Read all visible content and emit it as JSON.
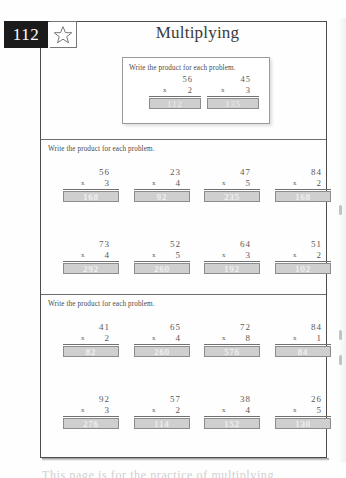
{
  "page": {
    "number": "112",
    "title": "Multiplying",
    "star_icon": "star-icon",
    "footer_text_partial": "This page is for the practice of multiplying"
  },
  "example": {
    "instruction": "Write the product for each problem.",
    "problems": [
      {
        "top": "56",
        "operator": "x",
        "bottom": "2",
        "answer": "112"
      },
      {
        "top": "45",
        "operator": "x",
        "bottom": "3",
        "answer": "135"
      }
    ]
  },
  "sections": [
    {
      "instruction": "Write the product for each problem.",
      "rows": [
        [
          {
            "top": "56",
            "operator": "x",
            "bottom": "3",
            "answer": "168"
          },
          {
            "top": "23",
            "operator": "x",
            "bottom": "4",
            "answer": "92"
          },
          {
            "top": "47",
            "operator": "x",
            "bottom": "5",
            "answer": "235"
          },
          {
            "top": "84",
            "operator": "x",
            "bottom": "2",
            "answer": "168"
          }
        ],
        [
          {
            "top": "73",
            "operator": "x",
            "bottom": "4",
            "answer": "292"
          },
          {
            "top": "52",
            "operator": "x",
            "bottom": "5",
            "answer": "260"
          },
          {
            "top": "64",
            "operator": "x",
            "bottom": "3",
            "answer": "192"
          },
          {
            "top": "51",
            "operator": "x",
            "bottom": "2",
            "answer": "102"
          }
        ]
      ]
    },
    {
      "instruction": "Write the product for each problem.",
      "rows": [
        [
          {
            "top": "41",
            "operator": "x",
            "bottom": "2",
            "answer": "82"
          },
          {
            "top": "65",
            "operator": "x",
            "bottom": "4",
            "answer": "260"
          },
          {
            "top": "72",
            "operator": "x",
            "bottom": "8",
            "answer": "576"
          },
          {
            "top": "84",
            "operator": "x",
            "bottom": "1",
            "answer": "84"
          }
        ],
        [
          {
            "top": "92",
            "operator": "x",
            "bottom": "3",
            "answer": "276"
          },
          {
            "top": "57",
            "operator": "x",
            "bottom": "2",
            "answer": "114"
          },
          {
            "top": "38",
            "operator": "x",
            "bottom": "4",
            "answer": "152"
          },
          {
            "top": "26",
            "operator": "x",
            "bottom": "5",
            "answer": "130"
          }
        ]
      ]
    }
  ],
  "colors": {
    "badge_bg": "#1b1b1b",
    "answer_fill": "#cfcfcf",
    "ink": "#4a4a4a",
    "rule": "#6f6f6f"
  }
}
